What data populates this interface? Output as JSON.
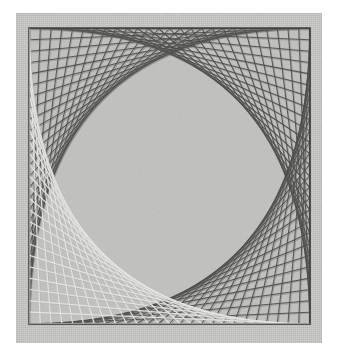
{
  "artwork": {
    "title": "Curve-stitching string art",
    "medium": "thread on card",
    "mat_color": "#c9c9c7",
    "field_color": "#c4c4c2",
    "paper_margin_color": "#ffffff",
    "dark_thread_color": "#4e4e4c",
    "dark_thread_shadow": "#6e6e6b",
    "light_thread_color": "#ececea",
    "light_thread_shadow": "#b0b0ad",
    "border_line_color": "#3a3a38",
    "thread_count_per_corner": 26,
    "square": {
      "x": 28,
      "y": 27,
      "width": 283,
      "height": 298
    },
    "corners": [
      {
        "name": "top-left",
        "thread_style": "dark",
        "threads": 26
      },
      {
        "name": "top-right",
        "thread_style": "dark",
        "threads": 26
      },
      {
        "name": "bottom-right",
        "thread_style": "dark",
        "threads": 26
      },
      {
        "name": "bottom-left",
        "thread_style": "light",
        "threads": 26
      }
    ],
    "envelope_shape": "parabola",
    "center_region": "open light-grey ground"
  },
  "chart_data": {
    "type": "line",
    "xlabel": "",
    "ylabel": "",
    "xlim": [
      0,
      283
    ],
    "ylim": [
      0,
      298
    ],
    "grid": false,
    "legend": "none",
    "series": [
      {
        "name": "top-left-dark",
        "color": "#4e4e4c",
        "segments": 26,
        "envelope": "parabola",
        "anchors": "top-edge to left-edge"
      },
      {
        "name": "top-right-dark",
        "color": "#4e4e4c",
        "segments": 26,
        "envelope": "parabola",
        "anchors": "top-edge to right-edge"
      },
      {
        "name": "bottom-right-dark",
        "color": "#4e4e4c",
        "segments": 26,
        "envelope": "parabola",
        "anchors": "right-edge to bottom-edge"
      },
      {
        "name": "bottom-left-light",
        "color": "#ececea",
        "segments": 26,
        "envelope": "parabola",
        "anchors": "left-edge to bottom-edge"
      }
    ]
  }
}
